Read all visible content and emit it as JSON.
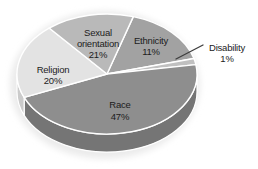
{
  "chart_data": {
    "type": "pie",
    "style": "3d",
    "title": "",
    "unit": "%",
    "legend_position": "none",
    "data_labels": "category name and percent on or beside slices",
    "categories": [
      "Sexual orientation",
      "Ethnicity",
      "Disability",
      "Race",
      "Religion"
    ],
    "values": [
      21,
      11,
      1,
      47,
      20
    ],
    "segments": [
      {
        "name": "Ethnicity",
        "value": 11,
        "color": "#a2a2a2",
        "side_color": "#8a8a8a",
        "arc": [
          17,
          75
        ]
      },
      {
        "name": "Disability",
        "value": 1,
        "color": "#c0c0c0",
        "side_color": "#a8a8a8",
        "arc": [
          75,
          81
        ]
      },
      {
        "name": "Race",
        "value": 47,
        "color": "#8e8e8e",
        "side_color": "#757575",
        "arc": [
          81,
          247
        ]
      },
      {
        "name": "Religion",
        "value": 20,
        "color": "#e3e3e3",
        "side_color": "#cbcbcb",
        "arc": [
          247,
          320
        ]
      },
      {
        "name": "Sexual orientation",
        "value": 21,
        "color": "#b9b9b9",
        "side_color": "#9f9f9f",
        "arc": [
          320,
          377
        ]
      }
    ],
    "geometry": {
      "cx": 107,
      "cy": 74,
      "rx": 90,
      "ry": 60,
      "depth": 18,
      "front_arc": [
        90,
        270
      ]
    },
    "labels": [
      {
        "segment": "Sexual orientation",
        "lines": [
          "Sexual",
          "orientation",
          "21%"
        ],
        "x": 98,
        "y": 33,
        "lh": 11
      },
      {
        "segment": "Ethnicity",
        "lines": [
          "Ethnicity",
          "11%"
        ],
        "x": 151,
        "y": 41,
        "lh": 11.5
      },
      {
        "segment": "Disability",
        "lines": [
          "Disability",
          "1%"
        ],
        "x": 227,
        "y": 48,
        "lh": 11
      },
      {
        "segment": "Race",
        "lines": [
          "Race",
          "47%"
        ],
        "x": 120,
        "y": 105,
        "lh": 12
      },
      {
        "segment": "Religion",
        "lines": [
          "Religion",
          "20%"
        ],
        "x": 53,
        "y": 70,
        "lh": 11
      }
    ],
    "leader_line": {
      "from": [
        176,
        59
      ],
      "to": [
        203,
        45
      ],
      "color": "#3d3d3d"
    },
    "slice_border_color": "#ffffff",
    "text_color": "#1c1c1c",
    "shadow_color": "#ebebeb",
    "background": "#ffffff",
    "font_size": 9.5
  }
}
